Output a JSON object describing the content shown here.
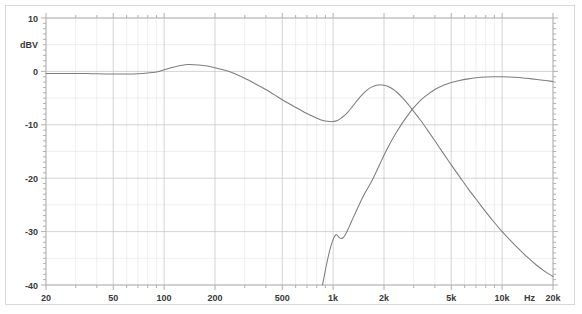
{
  "chart_data": {
    "type": "line",
    "title": "",
    "xlabel": "Hz",
    "ylabel": "dBV",
    "xscale": "log",
    "xlim": [
      20,
      20000
    ],
    "ylim": [
      -40,
      10
    ],
    "grid": true,
    "legend": false,
    "x_ticks": [
      {
        "value": 20,
        "label": "20"
      },
      {
        "value": 50,
        "label": "50"
      },
      {
        "value": 100,
        "label": "100"
      },
      {
        "value": 200,
        "label": "200"
      },
      {
        "value": 500,
        "label": "500"
      },
      {
        "value": 1000,
        "label": "1k"
      },
      {
        "value": 2000,
        "label": "2k"
      },
      {
        "value": 5000,
        "label": "5k"
      },
      {
        "value": 10000,
        "label": "10k"
      },
      {
        "value": 20000,
        "label": "20k"
      }
    ],
    "y_ticks": [
      {
        "value": 10,
        "label": "10"
      },
      {
        "value": 0,
        "label": "0"
      },
      {
        "value": -10,
        "label": "-10"
      },
      {
        "value": -20,
        "label": "-20"
      },
      {
        "value": -30,
        "label": "-30"
      },
      {
        "value": -40,
        "label": "-40"
      }
    ],
    "unit_label": "Hz",
    "axis_unit_label": "dBV",
    "line_color": "#7d7d7d",
    "grid_color": "#c2c2c2",
    "minor_grid_color": "#e2e2e2",
    "series": [
      {
        "name": "lowpass-response",
        "points": [
          [
            20,
            -0.4
          ],
          [
            25,
            -0.4
          ],
          [
            30,
            -0.4
          ],
          [
            35,
            -0.4
          ],
          [
            40,
            -0.45
          ],
          [
            50,
            -0.5
          ],
          [
            60,
            -0.5
          ],
          [
            70,
            -0.45
          ],
          [
            80,
            -0.3
          ],
          [
            90,
            -0.1
          ],
          [
            100,
            0.3
          ],
          [
            110,
            0.7
          ],
          [
            125,
            1.1
          ],
          [
            140,
            1.3
          ],
          [
            160,
            1.2
          ],
          [
            180,
            1.0
          ],
          [
            200,
            0.7
          ],
          [
            230,
            0.2
          ],
          [
            260,
            -0.4
          ],
          [
            300,
            -1.3
          ],
          [
            350,
            -2.4
          ],
          [
            400,
            -3.4
          ],
          [
            450,
            -4.4
          ],
          [
            500,
            -5.3
          ],
          [
            560,
            -6.2
          ],
          [
            630,
            -7.1
          ],
          [
            700,
            -7.9
          ],
          [
            780,
            -8.6
          ],
          [
            850,
            -9.1
          ],
          [
            900,
            -9.3
          ],
          [
            950,
            -9.4
          ],
          [
            1000,
            -9.4
          ],
          [
            1060,
            -9.2
          ],
          [
            1120,
            -8.7
          ],
          [
            1200,
            -7.9
          ],
          [
            1300,
            -6.6
          ],
          [
            1400,
            -5.3
          ],
          [
            1500,
            -4.2
          ],
          [
            1600,
            -3.4
          ],
          [
            1700,
            -2.9
          ],
          [
            1800,
            -2.6
          ],
          [
            1900,
            -2.5
          ],
          [
            2000,
            -2.6
          ],
          [
            2100,
            -2.8
          ],
          [
            2250,
            -3.3
          ],
          [
            2400,
            -4.0
          ],
          [
            2600,
            -5.1
          ],
          [
            2800,
            -6.3
          ],
          [
            3000,
            -7.5
          ],
          [
            3300,
            -9.2
          ],
          [
            3600,
            -10.9
          ],
          [
            4000,
            -13.0
          ],
          [
            4500,
            -15.4
          ],
          [
            5000,
            -17.5
          ],
          [
            5600,
            -19.7
          ],
          [
            6300,
            -22.0
          ],
          [
            7000,
            -23.9
          ],
          [
            8000,
            -26.3
          ],
          [
            9000,
            -28.3
          ],
          [
            10000,
            -30.0
          ],
          [
            11000,
            -31.4
          ],
          [
            12500,
            -33.2
          ],
          [
            14000,
            -34.7
          ],
          [
            16000,
            -36.3
          ],
          [
            18000,
            -37.5
          ],
          [
            20000,
            -38.4
          ]
        ]
      },
      {
        "name": "highpass-response",
        "points": [
          [
            865,
            -40.0
          ],
          [
            880,
            -38.8
          ],
          [
            900,
            -37.2
          ],
          [
            925,
            -35.4
          ],
          [
            950,
            -33.8
          ],
          [
            975,
            -32.5
          ],
          [
            1000,
            -31.5
          ],
          [
            1020,
            -30.9
          ],
          [
            1040,
            -30.6
          ],
          [
            1060,
            -30.7
          ],
          [
            1085,
            -31.1
          ],
          [
            1110,
            -31.3
          ],
          [
            1140,
            -31.2
          ],
          [
            1175,
            -30.7
          ],
          [
            1220,
            -29.7
          ],
          [
            1280,
            -28.2
          ],
          [
            1350,
            -26.6
          ],
          [
            1420,
            -25.1
          ],
          [
            1500,
            -23.5
          ],
          [
            1580,
            -22.2
          ],
          [
            1650,
            -21.2
          ],
          [
            1720,
            -20.1
          ],
          [
            1800,
            -18.8
          ],
          [
            1900,
            -17.2
          ],
          [
            2000,
            -15.7
          ],
          [
            2120,
            -14.1
          ],
          [
            2250,
            -12.6
          ],
          [
            2400,
            -11.1
          ],
          [
            2600,
            -9.4
          ],
          [
            2800,
            -8.0
          ],
          [
            3000,
            -6.8
          ],
          [
            3300,
            -5.4
          ],
          [
            3600,
            -4.4
          ],
          [
            4000,
            -3.4
          ],
          [
            4500,
            -2.6
          ],
          [
            5000,
            -2.1
          ],
          [
            5600,
            -1.7
          ],
          [
            6300,
            -1.4
          ],
          [
            7000,
            -1.2
          ],
          [
            8000,
            -1.05
          ],
          [
            9000,
            -1.0
          ],
          [
            10000,
            -1.0
          ],
          [
            11000,
            -1.05
          ],
          [
            12500,
            -1.15
          ],
          [
            14000,
            -1.3
          ],
          [
            16000,
            -1.5
          ],
          [
            18000,
            -1.7
          ],
          [
            20000,
            -1.9
          ]
        ]
      }
    ]
  }
}
